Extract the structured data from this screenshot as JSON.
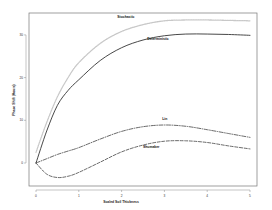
{
  "chart_data": {
    "type": "line",
    "title": "",
    "xlabel": "Scaled Soil Thickness",
    "ylabel": "Phase Shift (Hours)",
    "xlim": [
      0,
      5
    ],
    "ylim": [
      -5,
      36
    ],
    "x_ticks": [
      0,
      1,
      2,
      3,
      4,
      5
    ],
    "x_tick_labels": [
      "0",
      "1",
      "2",
      "3",
      "4",
      "5"
    ],
    "y_ticks": [
      0,
      10,
      20,
      30
    ],
    "y_tick_labels": [
      "0",
      "10",
      "20",
      "30"
    ],
    "grid": false,
    "legend": "inline labels",
    "x": [
      0,
      0.25,
      0.5,
      0.75,
      1,
      1.5,
      2,
      2.5,
      3,
      3.5,
      4,
      4.5,
      5
    ],
    "series": [
      {
        "name": "Stochastic",
        "style": "dotted",
        "color": "#c8c8c8",
        "values": [
          2.5,
          9.5,
          15.5,
          20.0,
          23.5,
          28.0,
          30.8,
          32.4,
          33.3,
          33.5,
          33.5,
          33.4,
          33.3
        ],
        "label_pos": [
          1.9,
          34.0
        ]
      },
      {
        "name": "Deterministic",
        "style": "solid",
        "color": "#333333",
        "values": [
          0,
          7.5,
          13.5,
          17.0,
          19.5,
          24.0,
          27.0,
          28.8,
          29.8,
          30.2,
          30.2,
          30.1,
          29.9
        ],
        "label_pos": [
          2.6,
          28.8
        ]
      },
      {
        "name": "Lin",
        "style": "dashdot",
        "color": "#444444",
        "values": [
          0,
          1.0,
          2.0,
          2.8,
          3.6,
          5.6,
          7.4,
          8.5,
          8.9,
          8.6,
          7.8,
          6.9,
          6.0
        ],
        "label_pos": [
          2.95,
          10.0
        ]
      },
      {
        "name": "Shumaker",
        "style": "dashed",
        "color": "#444444",
        "values": [
          0,
          -2.6,
          -3.4,
          -3.1,
          -2.2,
          0.2,
          2.6,
          4.2,
          5.1,
          5.2,
          4.8,
          4.0,
          3.3
        ],
        "label_pos": [
          2.5,
          3.4
        ]
      }
    ]
  }
}
